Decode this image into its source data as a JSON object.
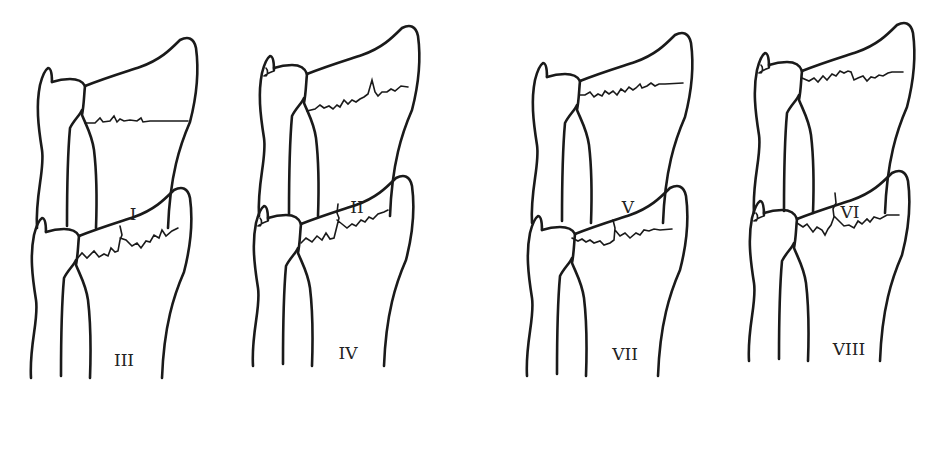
{
  "figure": {
    "line_color": "#1a1a1a",
    "background": "#ffffff"
  },
  "panels": [
    {
      "id": "I",
      "label": "I",
      "ulnar_styloid_fracture": false,
      "radial_fracture": "transverse-extraarticular"
    },
    {
      "id": "II",
      "label": "II",
      "ulnar_styloid_fracture": true,
      "radial_fracture": "transverse-extraarticular"
    },
    {
      "id": "III",
      "label": "III",
      "ulnar_styloid_fracture": false,
      "radial_fracture": "radiocarpal-intraarticular"
    },
    {
      "id": "IV",
      "label": "IV",
      "ulnar_styloid_fracture": true,
      "radial_fracture": "radiocarpal-intraarticular"
    },
    {
      "id": "V",
      "label": "V",
      "ulnar_styloid_fracture": false,
      "radial_fracture": "distal-radioulnar-joint"
    },
    {
      "id": "VI",
      "label": "VI",
      "ulnar_styloid_fracture": true,
      "radial_fracture": "distal-radioulnar-joint"
    },
    {
      "id": "VII",
      "label": "VII",
      "ulnar_styloid_fracture": false,
      "radial_fracture": "radiocarpal-and-radioulnar"
    },
    {
      "id": "VIII",
      "label": "VIII",
      "ulnar_styloid_fracture": true,
      "radial_fracture": "radiocarpal-and-radioulnar"
    }
  ]
}
